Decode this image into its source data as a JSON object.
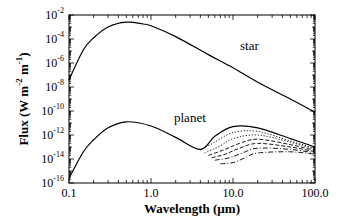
{
  "chart_data": {
    "type": "line",
    "title": "",
    "xlabel": "Wavelength (µm)",
    "ylabel": "Flux (W m^-2 m^-1)",
    "xscale": "log",
    "yscale": "log",
    "xlim": [
      0.1,
      100.0
    ],
    "ylim": [
      1e-16,
      0.01
    ],
    "xticks": [
      "0.1",
      "1.0",
      "10.0",
      "100.0"
    ],
    "yticks": [
      "10^-2",
      "10^-4",
      "10^-6",
      "10^-8",
      "10^-10",
      "10^-12",
      "10^-14",
      "10^-16"
    ],
    "grid": false,
    "annotations": [
      {
        "text": "star",
        "x": 10.0,
        "y": 3e-06
      },
      {
        "text": "planet",
        "x": 3.0,
        "y": 3e-11
      }
    ],
    "series": [
      {
        "name": "star",
        "style": "solid",
        "x": [
          0.1,
          0.15,
          0.2,
          0.3,
          0.5,
          0.8,
          1.0,
          2.0,
          5.0,
          10.0,
          20.0,
          50.0,
          100.0
        ],
        "log10_y": [
          -7.4,
          -4.9,
          -3.9,
          -3.0,
          -2.6,
          -2.75,
          -2.9,
          -3.8,
          -5.3,
          -6.4,
          -7.6,
          -9.0,
          -10.1
        ]
      },
      {
        "name": "planet (reflected, solid)",
        "style": "solid",
        "x": [
          0.1,
          0.15,
          0.2,
          0.3,
          0.5,
          1.0,
          2.0,
          4.0,
          6.0,
          10.0,
          20.0,
          50.0,
          100.0
        ],
        "log10_y": [
          -15.6,
          -13.4,
          -12.4,
          -11.4,
          -10.9,
          -11.25,
          -12.2,
          -13.2,
          -12.1,
          -11.3,
          -11.4,
          -12.3,
          -13.0
        ]
      },
      {
        "name": "planet variant 2",
        "style": "dotted",
        "x": [
          4.0,
          6.0,
          10.0,
          20.0,
          50.0,
          100.0
        ],
        "log10_y": [
          -13.25,
          -12.6,
          -11.8,
          -11.7,
          -12.5,
          -13.1
        ]
      },
      {
        "name": "planet variant 3",
        "style": "dotted",
        "x": [
          4.5,
          7.0,
          10.0,
          20.0,
          50.0,
          100.0
        ],
        "log10_y": [
          -13.5,
          -12.9,
          -12.3,
          -12.0,
          -12.6,
          -13.2
        ]
      },
      {
        "name": "planet variant 4",
        "style": "dashed",
        "x": [
          5.0,
          8.0,
          12.0,
          20.0,
          50.0,
          100.0
        ],
        "log10_y": [
          -13.7,
          -13.2,
          -12.7,
          -12.35,
          -12.8,
          -13.3
        ]
      },
      {
        "name": "planet variant 5",
        "style": "dashed",
        "x": [
          5.5,
          8.0,
          12.0,
          20.0,
          50.0,
          100.0
        ],
        "log10_y": [
          -13.9,
          -13.6,
          -13.1,
          -12.7,
          -13.0,
          -13.4
        ]
      },
      {
        "name": "planet variant 6",
        "style": "dash-dot",
        "x": [
          6.0,
          9.0,
          13.0,
          20.0,
          50.0,
          100.0
        ],
        "log10_y": [
          -14.1,
          -13.9,
          -13.5,
          -13.1,
          -13.2,
          -13.5
        ]
      },
      {
        "name": "planet variant 7",
        "style": "dash-dot",
        "x": [
          7.0,
          10.0,
          14.0,
          20.0,
          50.0,
          100.0
        ],
        "log10_y": [
          -14.4,
          -14.3,
          -13.9,
          -13.5,
          -13.4,
          -13.6
        ]
      }
    ]
  },
  "labels": {
    "xlabel": "Wavelength (µm)",
    "ylabel_prefix": "Flux (W m",
    "ylabel_exp1": "-2",
    "ylabel_mid": " m",
    "ylabel_exp2": "-1",
    "ylabel_suffix": ")",
    "star": "star",
    "planet": "planet",
    "xticks": [
      "0.1",
      "1.0",
      "10.0",
      "100.0"
    ],
    "ytick_base": "10",
    "ytick_exps": [
      "-2",
      "-4",
      "-6",
      "-8",
      "-10",
      "-12",
      "-14",
      "-16"
    ]
  }
}
